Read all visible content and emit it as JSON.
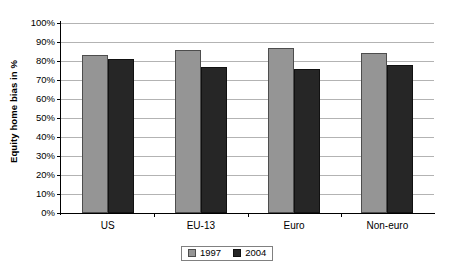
{
  "chart_data": {
    "type": "bar",
    "title": "",
    "xlabel": "",
    "ylabel": "Equity home bias in %",
    "categories": [
      "US",
      "EU-13",
      "Euro",
      "Non-euro"
    ],
    "series": [
      {
        "name": "1997",
        "color": "#959595",
        "values": [
          83,
          86,
          87,
          84
        ]
      },
      {
        "name": "2004",
        "color": "#262626",
        "values": [
          81,
          77,
          76,
          78
        ]
      }
    ],
    "ylim": [
      0,
      100
    ],
    "ytick_labels": [
      "0%",
      "10%",
      "20%",
      "30%",
      "40%",
      "50%",
      "60%",
      "70%",
      "80%",
      "90%",
      "100%"
    ],
    "ytick_values": [
      0,
      10,
      20,
      30,
      40,
      50,
      60,
      70,
      80,
      90,
      100
    ],
    "grid": true,
    "legend_position": "bottom-center"
  },
  "legend": {
    "items": [
      {
        "label": "1997",
        "swatch": "gray-square-icon"
      },
      {
        "label": "2004",
        "swatch": "black-square-icon"
      }
    ]
  },
  "axes": {
    "y_title": "Equity home bias in %"
  }
}
